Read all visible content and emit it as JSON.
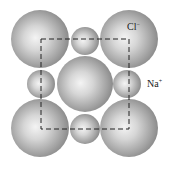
{
  "diagram": {
    "labels": {
      "chloride": {
        "base": "Cl",
        "charge": "−"
      },
      "sodium": {
        "base": "Na",
        "charge": "+"
      }
    },
    "ions": [
      {
        "type": "chloride",
        "cx": 40,
        "cy": 39,
        "r": 29
      },
      {
        "type": "chloride",
        "cx": 129,
        "cy": 39,
        "r": 29
      },
      {
        "type": "chloride",
        "cx": 85,
        "cy": 84,
        "r": 28
      },
      {
        "type": "chloride",
        "cx": 40,
        "cy": 128,
        "r": 29
      },
      {
        "type": "chloride",
        "cx": 129,
        "cy": 128,
        "r": 29
      },
      {
        "type": "sodium",
        "cx": 85,
        "cy": 41,
        "r": 14
      },
      {
        "type": "sodium",
        "cx": 41,
        "cy": 84,
        "r": 14
      },
      {
        "type": "sodium",
        "cx": 127,
        "cy": 84,
        "r": 14
      },
      {
        "type": "sodium",
        "cx": 85,
        "cy": 129,
        "r": 15
      }
    ],
    "unit_cell": {
      "x": 41,
      "y": 39,
      "width": 88,
      "height": 90
    },
    "colors": {
      "sphere_light": "#f2f2f2",
      "sphere_mid": "#b4b4b4",
      "sphere_dark": "#7a7a7a",
      "dash": "#222222"
    }
  }
}
